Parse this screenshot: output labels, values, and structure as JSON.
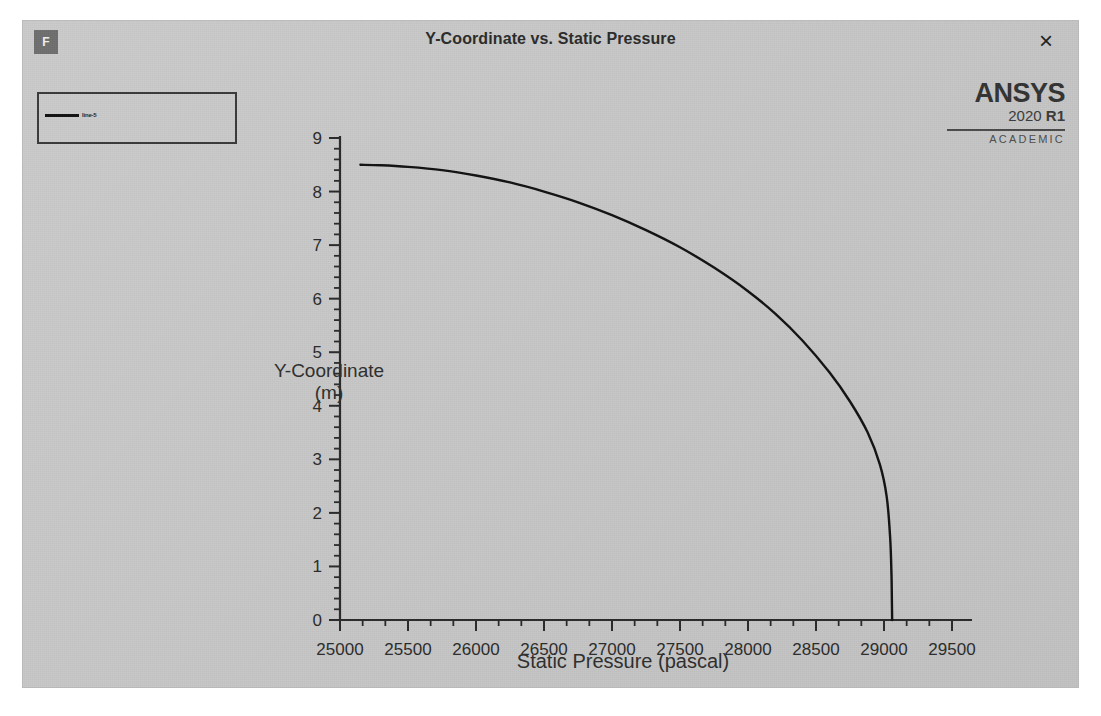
{
  "window": {
    "title": "Y-Coordinate vs. Static Pressure",
    "app_icon_label": "F",
    "close_label": "×"
  },
  "brand": {
    "name": "ANSYS",
    "version_year": "2020",
    "version_release": "R1",
    "license": "ACADEMIC"
  },
  "legend": {
    "entries": [
      {
        "label": "line-5",
        "color": "#111111"
      }
    ]
  },
  "chart_data": {
    "type": "line",
    "title": "Y-Coordinate vs. Static Pressure",
    "xlabel": "Static Pressure (pascal)",
    "ylabel": "Y-Coordinate\n(m)",
    "ylabel_line1": "Y-Coordinate",
    "ylabel_line2": "(m)",
    "xlim": [
      25000,
      29500
    ],
    "ylim": [
      0,
      9
    ],
    "xticks": [
      25000,
      25500,
      26000,
      26500,
      27000,
      27500,
      28000,
      28500,
      29000,
      29500
    ],
    "xtick_labels": [
      "25000",
      "25500",
      "26000",
      "26500",
      "27000",
      "27500",
      "28000",
      "28500",
      "29000",
      "29500"
    ],
    "yticks": [
      0,
      1,
      2,
      3,
      4,
      5,
      6,
      7,
      8,
      9
    ],
    "ytick_labels": [
      "0",
      "1",
      "2",
      "3",
      "4",
      "5",
      "6",
      "7",
      "8",
      "9"
    ],
    "x_minor_per_major": 2,
    "y_minor_per_major": 4,
    "grid": false,
    "legend_position": "top-left-outside",
    "series": [
      {
        "name": "line-5",
        "color": "#111111",
        "width": 2.4,
        "x": [
          25150,
          25300,
          25500,
          25750,
          26000,
          26250,
          26500,
          26750,
          27000,
          27250,
          27500,
          27750,
          28000,
          28200,
          28400,
          28600,
          28750,
          28880,
          28970,
          29020,
          29045,
          29055,
          29058,
          29060
        ],
        "y": [
          8.5,
          8.49,
          8.46,
          8.4,
          8.3,
          8.17,
          8.0,
          7.8,
          7.56,
          7.28,
          6.96,
          6.58,
          6.14,
          5.72,
          5.22,
          4.62,
          4.08,
          3.5,
          2.9,
          2.3,
          1.55,
          0.85,
          0.35,
          0.0
        ]
      }
    ]
  }
}
